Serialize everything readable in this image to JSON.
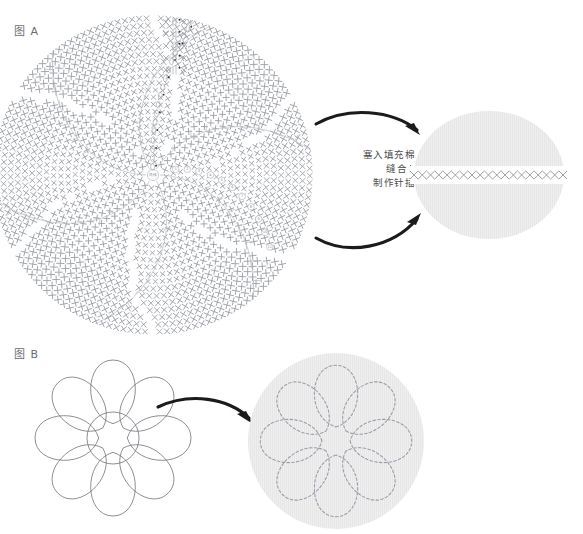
{
  "page": {
    "background": "#ffffff"
  },
  "figures": [
    {
      "id": "A",
      "label": "图 A",
      "label_x": 14,
      "label_y": 22,
      "chart": {
        "type": "crochet-chart",
        "center_x": 153,
        "center_y": 175,
        "radius": 160,
        "rounds": 11,
        "round_numbers": [
          "1",
          "2",
          "3",
          "4",
          "5",
          "6",
          "7",
          "8",
          "9",
          "10",
          "11"
        ],
        "stitch_symbol": "x",
        "spiral_sectors": 6,
        "symbol_color": "#9ca0a8",
        "guide_color": "#b9bcc2"
      },
      "result": {
        "shape": "circle",
        "center_x": 489,
        "center_y": 175,
        "radius_x": 75,
        "radius_y": 64,
        "fill": "#efefef",
        "seam_row": {
          "symbol": "×",
          "count": 19,
          "y": 175,
          "x_start": 414,
          "x_end": 563,
          "color": "#9ca0a8"
        }
      }
    },
    {
      "id": "B",
      "label": "图 B",
      "label_x": 14,
      "label_y": 345,
      "flower": {
        "center_x": 113,
        "center_y": 438,
        "petals": 8,
        "petal_length": 78,
        "core_radius": 26,
        "outline_color": "#6f7278"
      },
      "result": {
        "shape": "circle",
        "center_x": 336,
        "center_y": 441,
        "radius": 88,
        "fill": "#efefef",
        "stitch_style": "dashed",
        "stitch_color": "#9aa0a8",
        "petals": 8
      }
    }
  ],
  "instructions": {
    "lines": [
      "塞入填充棉",
      "缝合",
      "制作针插"
    ],
    "marker": "▶",
    "x": 333,
    "y": 148
  },
  "arrows": [
    {
      "name": "arrow-a-top",
      "from_x": 316,
      "from_y": 122,
      "to_x": 420,
      "to_y": 134,
      "direction": "right-down"
    },
    {
      "name": "arrow-a-bottom",
      "from_x": 316,
      "from_y": 236,
      "to_x": 420,
      "to_y": 214,
      "direction": "right-up"
    },
    {
      "name": "arrow-b",
      "from_x": 158,
      "from_y": 404,
      "to_x": 252,
      "to_y": 424,
      "direction": "right-down"
    }
  ],
  "colors": {
    "background": "#ffffff",
    "symbol": "#9ca0a8",
    "fabric": "#efefef",
    "arrow": "#1b1b1b",
    "text": "#4d4d4d",
    "outline": "#6f7278"
  }
}
